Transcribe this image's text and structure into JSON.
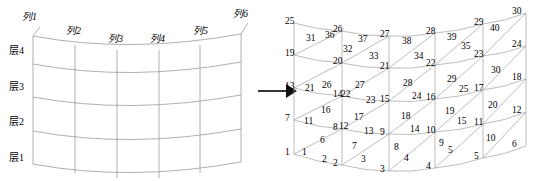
{
  "figure": {
    "type": "diagram",
    "transition_icon": "right-arrow-icon"
  },
  "left_diagram": {
    "name": "curved-grid-with-layer-and-column-labels",
    "column_labels": [
      {
        "text": "列1",
        "x": 22,
        "y": 11
      },
      {
        "text": "列2",
        "x": 68,
        "y": 25
      },
      {
        "text": "列3",
        "x": 110,
        "y": 32
      },
      {
        "text": "列4",
        "x": 152,
        "y": 32
      },
      {
        "text": "列5",
        "x": 196,
        "y": 25
      },
      {
        "text": "列6",
        "x": 232,
        "y": 8
      }
    ],
    "layer_labels": [
      {
        "text": "层4",
        "x": 12,
        "y": 45
      },
      {
        "text": "层3",
        "x": 12,
        "y": 81
      },
      {
        "text": "层2",
        "x": 12,
        "y": 117
      },
      {
        "text": "层1",
        "x": 12,
        "y": 152
      }
    ],
    "columns": 6,
    "layers": 4
  },
  "right_diagram": {
    "name": "numbered-triangular-mesh",
    "node_count": 30,
    "element_count": 40,
    "nodes": [
      {
        "id": "1",
        "lx": 1,
        "ly": 148
      },
      {
        "id": "2",
        "lx": 49,
        "ly": 159
      },
      {
        "id": "3",
        "lx": 96,
        "ly": 165
      },
      {
        "id": "4",
        "lx": 142,
        "ly": 162
      },
      {
        "id": "5",
        "lx": 190,
        "ly": 152
      },
      {
        "id": "6",
        "lx": 228,
        "ly": 140
      },
      {
        "id": "7",
        "lx": 1,
        "ly": 114
      },
      {
        "id": "8",
        "lx": 49,
        "ly": 123
      },
      {
        "id": "9",
        "lx": 96,
        "ly": 128
      },
      {
        "id": "10",
        "lx": 142,
        "ly": 126
      },
      {
        "id": "11",
        "lx": 190,
        "ly": 118
      },
      {
        "id": "12",
        "lx": 228,
        "ly": 106
      },
      {
        "id": "13",
        "lx": 1,
        "ly": 82
      },
      {
        "id": "14",
        "lx": 49,
        "ly": 90
      },
      {
        "id": "15",
        "lx": 96,
        "ly": 95
      },
      {
        "id": "16",
        "lx": 142,
        "ly": 93
      },
      {
        "id": "17",
        "lx": 190,
        "ly": 84
      },
      {
        "id": "18",
        "lx": 228,
        "ly": 73
      },
      {
        "id": "19",
        "lx": 1,
        "ly": 49
      },
      {
        "id": "20",
        "lx": 49,
        "ly": 57
      },
      {
        "id": "21",
        "lx": 96,
        "ly": 62
      },
      {
        "id": "22",
        "lx": 142,
        "ly": 59
      },
      {
        "id": "23",
        "lx": 190,
        "ly": 50
      },
      {
        "id": "24",
        "lx": 228,
        "ly": 40
      },
      {
        "id": "25",
        "lx": 1,
        "ly": 17
      },
      {
        "id": "26",
        "lx": 49,
        "ly": 25
      },
      {
        "id": "27",
        "lx": 96,
        "ly": 30
      },
      {
        "id": "28",
        "lx": 142,
        "ly": 27
      },
      {
        "id": "29",
        "lx": 190,
        "ly": 18
      },
      {
        "id": "30",
        "lx": 228,
        "ly": 7
      }
    ],
    "elements": [
      {
        "id": "1",
        "lx": 18,
        "ly": 148
      },
      {
        "id": "2",
        "lx": 38,
        "ly": 155
      },
      {
        "id": "3",
        "lx": 77,
        "ly": 155
      },
      {
        "id": "4",
        "lx": 120,
        "ly": 154
      },
      {
        "id": "5",
        "lx": 164,
        "ly": 146
      },
      {
        "id": "6",
        "lx": 36,
        "ly": 136
      },
      {
        "id": "7",
        "lx": 68,
        "ly": 142
      },
      {
        "id": "8",
        "lx": 110,
        "ly": 143
      },
      {
        "id": "9",
        "lx": 155,
        "ly": 139
      },
      {
        "id": "10",
        "lx": 202,
        "ly": 134
      },
      {
        "id": "11",
        "lx": 20,
        "ly": 117
      },
      {
        "id": "12",
        "lx": 55,
        "ly": 122
      },
      {
        "id": "13",
        "lx": 80,
        "ly": 127
      },
      {
        "id": "14",
        "lx": 126,
        "ly": 125
      },
      {
        "id": "15",
        "lx": 173,
        "ly": 117
      },
      {
        "id": "16",
        "lx": 37,
        "ly": 106
      },
      {
        "id": "17",
        "lx": 70,
        "ly": 113
      },
      {
        "id": "18",
        "lx": 117,
        "ly": 112
      },
      {
        "id": "19",
        "lx": 161,
        "ly": 107
      },
      {
        "id": "20",
        "lx": 204,
        "ly": 101
      },
      {
        "id": "21",
        "lx": 21,
        "ly": 84
      },
      {
        "id": "22",
        "lx": 57,
        "ly": 90
      },
      {
        "id": "23",
        "lx": 82,
        "ly": 96
      },
      {
        "id": "24",
        "lx": 128,
        "ly": 92
      },
      {
        "id": "25",
        "lx": 175,
        "ly": 85
      },
      {
        "id": "26",
        "lx": 38,
        "ly": 81
      },
      {
        "id": "27",
        "lx": 71,
        "ly": 81
      },
      {
        "id": "28",
        "lx": 119,
        "ly": 79
      },
      {
        "id": "29",
        "lx": 163,
        "ly": 75
      },
      {
        "id": "30",
        "lx": 207,
        "ly": 66
      },
      {
        "id": "31",
        "lx": 22,
        "ly": 34
      },
      {
        "id": "32",
        "lx": 59,
        "ly": 45
      },
      {
        "id": "33",
        "lx": 85,
        "ly": 52
      },
      {
        "id": "34",
        "lx": 130,
        "ly": 52
      },
      {
        "id": "35",
        "lx": 177,
        "ly": 42
      },
      {
        "id": "36",
        "lx": 41,
        "ly": 31
      },
      {
        "id": "37",
        "lx": 74,
        "ly": 35
      },
      {
        "id": "38",
        "lx": 118,
        "ly": 37
      },
      {
        "id": "39",
        "lx": 163,
        "ly": 33
      },
      {
        "id": "40",
        "lx": 206,
        "ly": 24
      }
    ]
  }
}
